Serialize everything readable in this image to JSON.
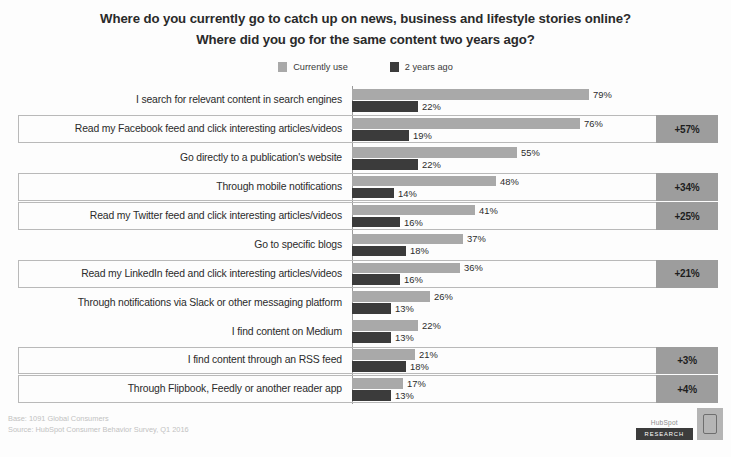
{
  "title": {
    "line1": "Where do you currently go to catch up on news, business and lifestyle stories online?",
    "line2": "Where did you go for the same content two years ago?"
  },
  "legend": {
    "items": [
      {
        "label": "Currently use",
        "color": "#a9a9a9"
      },
      {
        "label": "2 years ago",
        "color": "#3b3b3b"
      }
    ]
  },
  "footer": {
    "base": "Base: 1091 Global Consumers",
    "source": "Source: HubSpot Consumer Behavior Survey, Q1 2016"
  },
  "brand": {
    "word": "HubSpot",
    "chip": "RESEARCH"
  },
  "chart_data": {
    "type": "bar",
    "orientation": "horizontal",
    "title": "Where do you currently go to catch up on news, business and lifestyle stories online? Where did you go for the same content two years ago?",
    "xlabel": "",
    "ylabel": "",
    "xlim": [
      0,
      100
    ],
    "grid": false,
    "legend_position": "top-center",
    "categories": [
      "I search for relevant content in search engines",
      "Read my Facebook feed and click interesting articles/videos",
      "Go directly to a publication's website",
      "Through mobile notifications",
      "Read my Twitter feed and click interesting articles/videos",
      "Go to specific blogs",
      "Read my LinkedIn feed and click interesting articles/videos",
      "Through notifications via Slack or other messaging platform",
      "I find content on Medium",
      "I find content through an RSS feed",
      "Through Flipbook, Feedly or another reader app"
    ],
    "series": [
      {
        "name": "Currently use",
        "color": "#a9a9a9",
        "values": [
          79,
          76,
          55,
          48,
          41,
          37,
          36,
          26,
          22,
          21,
          17
        ],
        "labels": [
          "79%",
          "76%",
          "55%",
          "48%",
          "41%",
          "37%",
          "36%",
          "26%",
          "22%",
          "21%",
          "17%"
        ]
      },
      {
        "name": "2 years ago",
        "color": "#3b3b3b",
        "values": [
          22,
          19,
          22,
          14,
          16,
          18,
          16,
          13,
          13,
          18,
          13
        ],
        "labels": [
          "22%",
          "19%",
          "22%",
          "14%",
          "16%",
          "18%",
          "16%",
          "13%",
          "13%",
          "18%",
          "13%"
        ]
      }
    ],
    "annotations": [
      {
        "category_index": 1,
        "text": "+57%"
      },
      {
        "category_index": 3,
        "text": "+34%"
      },
      {
        "category_index": 4,
        "text": "+25%"
      },
      {
        "category_index": 6,
        "text": "+21%"
      },
      {
        "category_index": 9,
        "text": "+3%"
      },
      {
        "category_index": 10,
        "text": "+4%"
      }
    ],
    "highlighted_rows": [
      1,
      3,
      4,
      6,
      9,
      10
    ]
  }
}
